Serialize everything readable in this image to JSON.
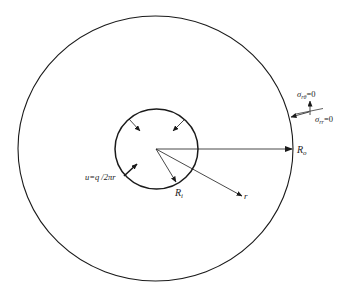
{
  "diagram": {
    "type": "hollow-cylinder-cross-section",
    "colors": {
      "stroke": "#1a1a1a",
      "text": "#222222",
      "background": "#ffffff"
    },
    "outer_circle": {
      "label_main": "R",
      "label_sub": "o"
    },
    "inner_circle": {
      "label_main": "R",
      "label_sub": "i"
    },
    "radial_coordinate": {
      "label": "r"
    },
    "inner_boundary_condition": {
      "label": "u=q /2πr"
    },
    "outer_boundary_conditions": {
      "shear": {
        "symbol": "σ",
        "sub": "rθ",
        "rhs": "=0"
      },
      "normal": {
        "symbol": "σ",
        "sub": "rr",
        "rhs": "=0"
      }
    }
  }
}
